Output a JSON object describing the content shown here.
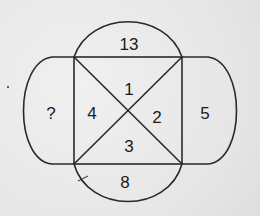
{
  "puzzle": {
    "top_arc": "13",
    "bottom_arc": "8",
    "left_lobe": "?",
    "right_lobe": "5",
    "triangle_top": "1",
    "triangle_right": "2",
    "triangle_bottom": "3",
    "triangle_left": "4"
  },
  "colors": {
    "stroke": "#2a2a2a",
    "background": "#ebebeb",
    "text": "#1a1a1a"
  }
}
